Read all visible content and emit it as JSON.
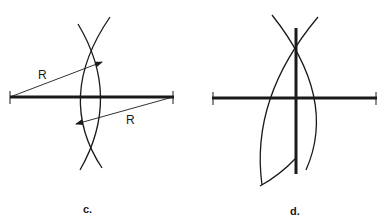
{
  "figure": {
    "panels": [
      {
        "id": "c",
        "label": "c.",
        "radius_labels": [
          "R",
          "R"
        ]
      },
      {
        "id": "d",
        "label": "d."
      }
    ]
  },
  "colors": {
    "ink": "#1a1a1a",
    "background": "#ffffff"
  }
}
